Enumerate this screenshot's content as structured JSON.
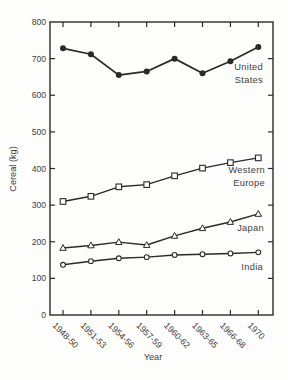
{
  "figure": {
    "background_color": "#fdfdfc",
    "ink_color": "#2a2a2a",
    "text_color": "#3d3d3d"
  },
  "chart_data": {
    "type": "line",
    "title": "",
    "xlabel": "Year",
    "ylabel": "Cereal (kg)",
    "ylim": [
      0,
      800
    ],
    "yticks": [
      0,
      100,
      200,
      300,
      400,
      500,
      600,
      700,
      800
    ],
    "grid": false,
    "legend_position": "inline-right-of-lines",
    "categories": [
      "1948-50",
      "1951-53",
      "1954-56",
      "1957-59",
      "1960-62",
      "1963-65",
      "1966-68",
      "1970"
    ],
    "series": [
      {
        "name": "United States",
        "label_lines": [
          "United",
          "States"
        ],
        "marker": "filled-circle",
        "values": [
          728,
          712,
          655,
          665,
          700,
          660,
          693,
          732
        ]
      },
      {
        "name": "Western Europe",
        "label_lines": [
          "Western",
          "Europe"
        ],
        "marker": "open-square",
        "values": [
          310,
          324,
          350,
          356,
          380,
          401,
          416,
          429
        ]
      },
      {
        "name": "Japan",
        "label_lines": [
          "Japan"
        ],
        "marker": "open-triangle",
        "values": [
          183,
          190,
          199,
          191,
          216,
          237,
          254,
          276
        ]
      },
      {
        "name": "India",
        "label_lines": [
          "India"
        ],
        "marker": "open-circle",
        "values": [
          137,
          147,
          155,
          158,
          164,
          166,
          168,
          171
        ]
      }
    ]
  }
}
